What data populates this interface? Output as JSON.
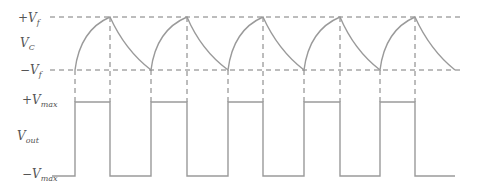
{
  "diagram": {
    "vc_plot": {
      "label_main": "V",
      "label_sub": "C",
      "top_level": {
        "sign": "+",
        "main": "V",
        "sub": "f"
      },
      "bottom_level": {
        "sign": "−",
        "main": "V",
        "sub": "f"
      }
    },
    "vout_plot": {
      "label_main": "V",
      "label_sub": "out",
      "top_level": {
        "sign": "+",
        "main": "V",
        "sub": "max"
      },
      "bottom_level": {
        "sign": "−",
        "main": "V",
        "sub": "max"
      }
    },
    "transition_x": [
      75,
      110,
      151,
      187,
      228,
      263,
      304,
      340,
      380,
      415,
      455
    ],
    "colors": {
      "waveform": "#9a9a9a",
      "dashed": "#7a7a7a",
      "label": "#555555"
    }
  }
}
